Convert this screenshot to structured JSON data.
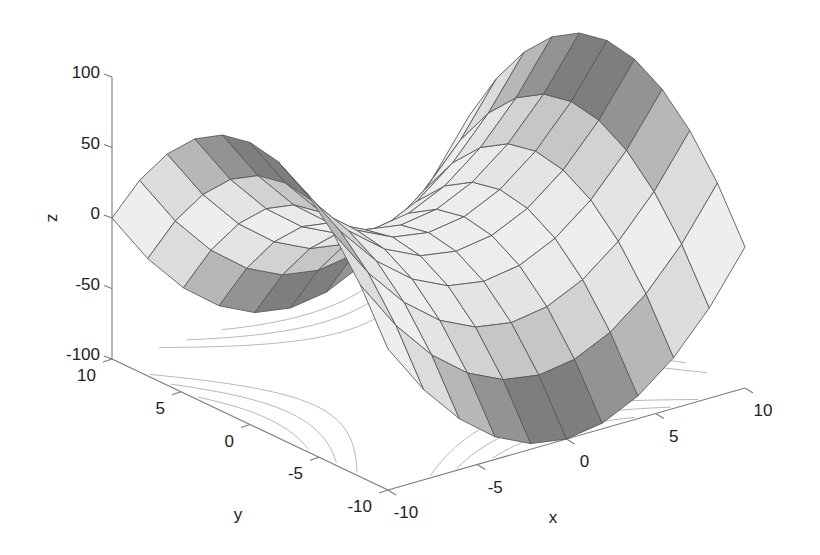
{
  "chart_data": {
    "type": "surface3d",
    "title": "",
    "function": "z = x^2 - y^2",
    "xlabel": "x",
    "ylabel": "y",
    "zlabel": "z",
    "xlim": [
      -10,
      10
    ],
    "ylim": [
      -10,
      10
    ],
    "zlim": [
      -100,
      100
    ],
    "x_ticks": [
      -10,
      -5,
      0,
      5,
      10
    ],
    "y_ticks": [
      -10,
      -5,
      0,
      5,
      10
    ],
    "z_ticks": [
      -100,
      -50,
      0,
      50,
      100
    ],
    "x_tick_labels": [
      "-10",
      "-5",
      "0",
      "5",
      "10"
    ],
    "y_tick_labels": [
      "-10",
      "-5",
      "0",
      "5",
      "10"
    ],
    "z_tick_labels": [
      "-100",
      "-50",
      "0",
      "50",
      "100"
    ],
    "grid_x": [
      -10,
      -8,
      -6,
      -4,
      -2,
      0,
      2,
      4,
      6,
      8,
      10
    ],
    "grid_y": [
      -10,
      -8,
      -6,
      -4,
      -2,
      0,
      2,
      4,
      6,
      8,
      10
    ],
    "colormap": "gray",
    "contours_on_floor": true,
    "contour_levels": [
      -80,
      -60,
      -40,
      40,
      60,
      80
    ],
    "grid": false,
    "legend": null
  },
  "projection": {
    "origin_px": [
      112,
      359
    ],
    "x_span_px": [
      357,
      -102
    ],
    "y_span_px": [
      276,
      131
    ],
    "z_span_px": [
      0,
      -282
    ]
  },
  "colors": {
    "edge": "#5a5a5a",
    "axis": "#7a7a7a",
    "contour": "#b8b8b8",
    "text": "#222222"
  }
}
